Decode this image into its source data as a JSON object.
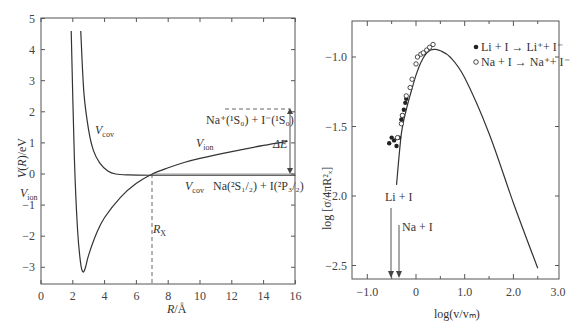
{
  "chart_data": [
    {
      "type": "line",
      "title": "",
      "xlabel": "R/Å",
      "ylabel": "V(R)/eV",
      "xlim": [
        0,
        16
      ],
      "ylim": [
        -3.5,
        5
      ],
      "xticks": [
        "0",
        "2",
        "4",
        "6",
        "8",
        "10",
        "12",
        "14",
        "16"
      ],
      "yticks": [
        "5",
        "4",
        "3",
        "2",
        "1",
        "0",
        "-1",
        "-2",
        "-3"
      ],
      "grid": false,
      "series": [
        {
          "name": "V_ion (ionic)",
          "x": [
            1.9,
            2.1,
            2.3,
            2.5,
            2.65,
            2.8,
            3.0,
            3.5,
            4.0,
            5.0,
            6.0,
            7.0,
            8.0,
            9.0,
            10.0,
            12.0,
            14.0,
            15.5
          ],
          "y": [
            4.6,
            0.5,
            -1.8,
            -2.9,
            -3.15,
            -3.0,
            -2.6,
            -1.9,
            -1.4,
            -0.75,
            -0.3,
            0.0,
            0.2,
            0.37,
            0.5,
            0.72,
            0.92,
            1.05
          ]
        },
        {
          "name": "V_cov (covalent)",
          "x": [
            2.5,
            2.7,
            3.0,
            3.3,
            3.7,
            4.2,
            4.7,
            5.5,
            7.0,
            10.0,
            16.0
          ],
          "y": [
            4.6,
            2.6,
            1.4,
            0.75,
            0.35,
            0.1,
            0.0,
            -0.03,
            -0.04,
            -0.04,
            -0.04
          ]
        }
      ],
      "annotations": [
        {
          "text": "V_ion",
          "x": 0.6,
          "y": -0.1
        },
        {
          "text": "V_cov",
          "x": 3.5,
          "y": 1.0
        },
        {
          "text": "V_ion",
          "x": 11.3,
          "y": 0.7
        },
        {
          "text": "V_cov",
          "x": 11.3,
          "y": -0.4
        },
        {
          "text": "Na(2S1/2) + I(2P3/2)",
          "x": 13.5,
          "y": -0.4
        },
        {
          "text": "Na+(1S0) + I−(1S0)",
          "x": 13.0,
          "y": 2.0
        },
        {
          "text": "ΔE",
          "x": 15.5,
          "y": 0.5
        },
        {
          "text": "R_X",
          "x": 7.0,
          "y": -1.9
        }
      ],
      "crossing_Rx": 7.0,
      "asymptote_ion_eV": 2.1
    },
    {
      "type": "scatter",
      "title": "",
      "xlabel": "log(v/v_m)",
      "ylabel": "log [σ/4πR_x²]",
      "xlim": [
        -1.3,
        3.0
      ],
      "ylim": [
        -2.6,
        -0.75
      ],
      "xticks": [
        "-1.0",
        "0",
        "1.0",
        "2.0",
        "3.0"
      ],
      "yticks": [
        "-1.0",
        "-1.5",
        "-2.0",
        "-2.5"
      ],
      "grid": false,
      "legend_position": "upper right",
      "legend": [
        "Li + I → Li⁺ + I⁻",
        "Na + I → Na⁺ + I⁻"
      ],
      "series": [
        {
          "name": "theory curve",
          "kind": "line",
          "x": [
            -0.4,
            -0.3,
            -0.2,
            -0.1,
            0.0,
            0.1,
            0.2,
            0.3,
            0.4,
            0.5,
            0.7,
            1.0,
            1.5,
            2.0,
            2.5
          ],
          "y": [
            -1.92,
            -1.55,
            -1.38,
            -1.25,
            -1.13,
            -1.04,
            -0.98,
            -0.95,
            -0.945,
            -0.955,
            -1.0,
            -1.15,
            -1.55,
            -2.05,
            -2.52
          ]
        },
        {
          "name": "Li + I → Li⁺ + I⁻",
          "kind": "filled-circle",
          "x": [
            -0.55,
            -0.5,
            -0.45,
            -0.4,
            -0.35,
            -0.3,
            -0.28,
            -0.25,
            -0.22,
            -0.2
          ],
          "y": [
            -1.62,
            -1.58,
            -1.6,
            -1.64,
            -1.58,
            -1.45,
            -1.42,
            -1.38,
            -1.33,
            -1.3
          ]
        },
        {
          "name": "Na + I → Na⁺ + I⁻",
          "kind": "open-circle",
          "x": [
            -0.38,
            -0.3,
            -0.28,
            -0.2,
            -0.12,
            -0.08,
            0.0,
            0.03,
            0.1,
            0.15,
            0.22,
            0.28,
            0.35
          ],
          "y": [
            -1.58,
            -1.48,
            -1.42,
            -1.28,
            -1.22,
            -1.16,
            -1.05,
            -1.0,
            -0.98,
            -0.97,
            -0.95,
            -0.93,
            -0.91
          ]
        }
      ],
      "annotations": [
        {
          "text": "Li + I",
          "x": -0.5,
          "y": -2.0,
          "arrow_to_x": -0.52
        },
        {
          "text": "Na + I",
          "x": -0.3,
          "y": -2.2,
          "arrow_to_x": -0.36
        }
      ]
    }
  ],
  "left": {
    "ylabel": "V(R)/eV",
    "xlabel": "R/Å",
    "xticks": [
      "0",
      "2",
      "4",
      "6",
      "8",
      "10",
      "12",
      "14",
      "16"
    ],
    "yticks": [
      "5",
      "4",
      "3",
      "2",
      "1",
      "0",
      "-1",
      "-2",
      "-3"
    ],
    "label_vion_left": "V",
    "label_vion_sub": "ion",
    "label_vcov_left": "V",
    "label_vcov_sub": "cov",
    "label_vion_right": "V",
    "label_vcov_right": "V",
    "label_rx": "R",
    "label_rx_sub": "X",
    "label_de": "ΔE",
    "label_ion_state": "Na⁺(¹S₀) + I⁻(¹S₀)",
    "label_cov_state": "Na(²S₁/₂) + I(²P₃/₂)"
  },
  "right": {
    "ylabel": "log [σ/4πR²ₓ]",
    "xlabel": "log(v/vₘ)",
    "xticks": [
      "−1.0",
      "0",
      "1.0",
      "2.0",
      "3.0"
    ],
    "yticks": [
      "−1.0",
      "−1.5",
      "−2.0",
      "−2.5"
    ],
    "legend_li": "Li + I → Li⁺+ I⁻",
    "legend_na": "Na + I → Na⁺+ I⁻",
    "label_li": "Li + I",
    "label_na": "Na + I"
  }
}
